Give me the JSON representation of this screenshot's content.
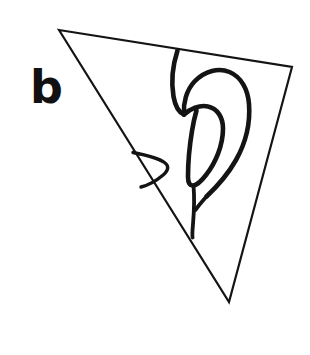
{
  "figure": {
    "panel_label": "b",
    "caption": "",
    "background_color": "#ffffff",
    "ink_color": "#111111",
    "width": 310,
    "height": 355,
    "shapes": {
      "triangle": {
        "name": "triangular-frame",
        "stroke_color": "#141414",
        "stroke_width": 2.2,
        "fill": "none",
        "vertices": [
          [
            59,
            30
          ],
          [
            292,
            67
          ],
          [
            229,
            302
          ]
        ],
        "points_attr": "59,30 292,67 229,302"
      },
      "ear": {
        "name": "ear-outline",
        "stroke_color": "#141414",
        "stroke_width": 4.6,
        "fill": "none",
        "parts": [
          {
            "name": "crus-of-helix",
            "d": "M 177.5 50.5 C 172.5 66 171.0 82 173.5 96.5 C 175.2 106.0 179.0 112.5 184.0 114.5"
          },
          {
            "name": "helix-outer-curve",
            "d": "M 184.0 114.5 C 183.0 103.0 186.5 90.0 194.5 81.5 C 205.0 70.5 219.0 67.5 229.5 72.0 C 241.5 77.0 248.0 90.0 249.0 104.0 C 250.5 124.0 245.0 144.0 236.0 160.0 C 227.5 175.0 216.0 187.5 206.5 196.5"
          },
          {
            "name": "antihelix-loop",
            "d": "M 184.0 114.5 C 190.0 109.0 199.5 104.5 208.0 106.5 C 217.5 108.5 223.0 117.5 223.0 128.5 C 223.0 145.5 215.5 163.0 206.0 175.0 C 201.0 181.5 196.5 185.0 193.5 185.5 C 190.0 186.0 188.0 183.0 188.0 177.0 C 188.0 164.0 189.5 146.0 192.0 131.0 C 193.5 121.5 195.5 114.0 196.5 110.5"
          },
          {
            "name": "tragus-hook",
            "d": "M 133.0 152.5 C 146.0 155.0 159.0 158.5 164.5 162.5 C 169.5 166.0 168.5 170.5 162.5 175.5 C 156.0 181.0 147.0 185.5 141.0 187.0"
          },
          {
            "name": "antitragus-lobule-line",
            "d": "M 193.5 185.5 C 194.5 197.0 194.0 212.5 193.0 224.0 C 192.3 232.0 192.0 235.5 192.6 237.5"
          },
          {
            "name": "helix-descending-tail",
            "d": "M 206.5 196.5 C 203.0 200.5 198.5 205.5 195.5 210.0"
          }
        ]
      }
    }
  }
}
